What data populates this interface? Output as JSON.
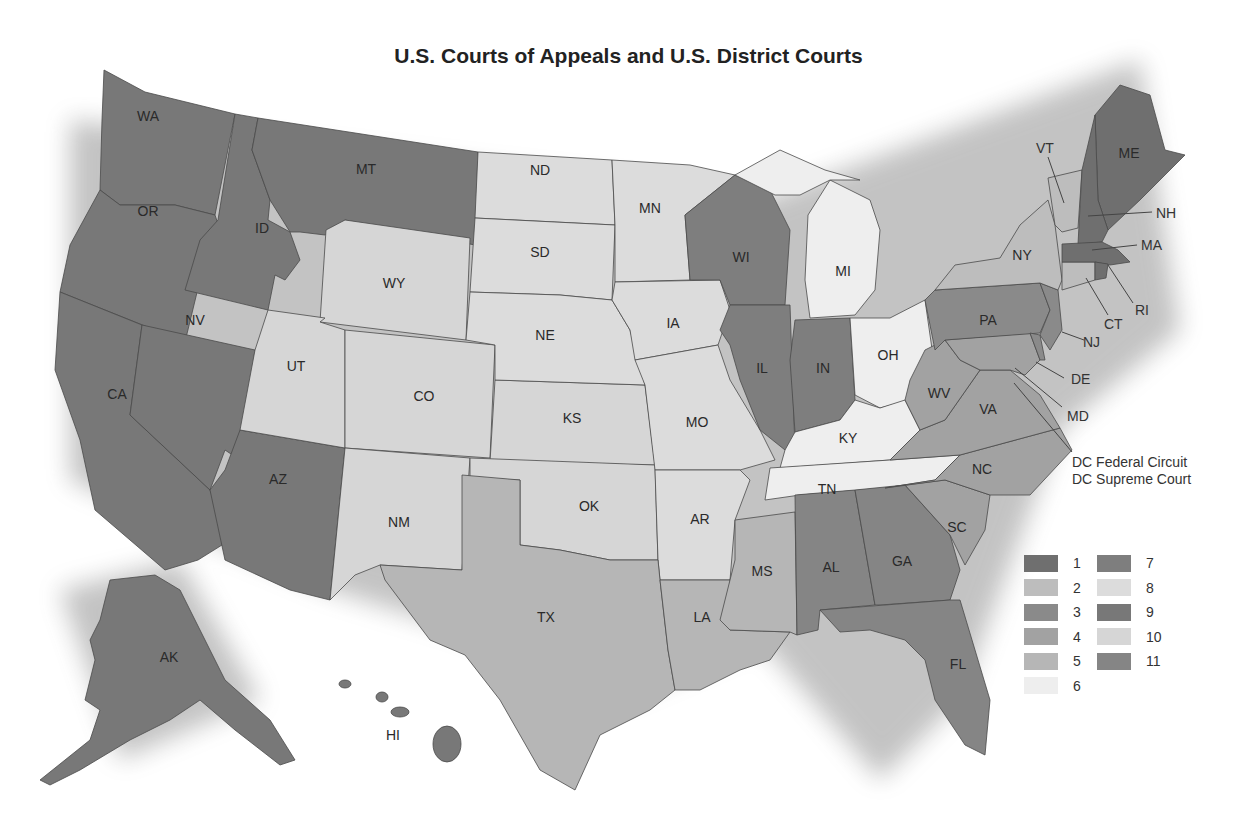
{
  "title": "U.S. Courts of Appeals and U.S. District Courts",
  "circuit_colors": {
    "1": "#6f6f6f",
    "2": "#bdbdbd",
    "3": "#8a8a8a",
    "4": "#a2a2a2",
    "5": "#b6b6b6",
    "6": "#eeeeee",
    "7": "#7e7e7e",
    "8": "#dcdcdc",
    "9": "#787878",
    "10": "#d6d6d6",
    "11": "#858585"
  },
  "legend": {
    "left_column": [
      {
        "circuit": "1",
        "label": "1"
      },
      {
        "circuit": "2",
        "label": "2"
      },
      {
        "circuit": "3",
        "label": "3"
      },
      {
        "circuit": "4",
        "label": "4"
      },
      {
        "circuit": "5",
        "label": "5"
      },
      {
        "circuit": "6",
        "label": "6"
      }
    ],
    "right_column": [
      {
        "circuit": "7",
        "label": "7"
      },
      {
        "circuit": "8",
        "label": "8"
      },
      {
        "circuit": "9",
        "label": "9"
      },
      {
        "circuit": "10",
        "label": "10"
      },
      {
        "circuit": "11",
        "label": "11"
      }
    ]
  },
  "states": [
    {
      "abbr": "WA",
      "circuit": "9"
    },
    {
      "abbr": "OR",
      "circuit": "9"
    },
    {
      "abbr": "CA",
      "circuit": "9"
    },
    {
      "abbr": "ID",
      "circuit": "9"
    },
    {
      "abbr": "MT",
      "circuit": "9"
    },
    {
      "abbr": "NV",
      "circuit": "9"
    },
    {
      "abbr": "AZ",
      "circuit": "9"
    },
    {
      "abbr": "AK",
      "circuit": "9"
    },
    {
      "abbr": "HI",
      "circuit": "9"
    },
    {
      "abbr": "WY",
      "circuit": "10"
    },
    {
      "abbr": "UT",
      "circuit": "10"
    },
    {
      "abbr": "CO",
      "circuit": "10"
    },
    {
      "abbr": "NM",
      "circuit": "10"
    },
    {
      "abbr": "KS",
      "circuit": "10"
    },
    {
      "abbr": "OK",
      "circuit": "10"
    },
    {
      "abbr": "ND",
      "circuit": "8"
    },
    {
      "abbr": "SD",
      "circuit": "8"
    },
    {
      "abbr": "NE",
      "circuit": "8"
    },
    {
      "abbr": "MN",
      "circuit": "8"
    },
    {
      "abbr": "IA",
      "circuit": "8"
    },
    {
      "abbr": "MO",
      "circuit": "8"
    },
    {
      "abbr": "AR",
      "circuit": "8"
    },
    {
      "abbr": "TX",
      "circuit": "5"
    },
    {
      "abbr": "LA",
      "circuit": "5"
    },
    {
      "abbr": "MS",
      "circuit": "5"
    },
    {
      "abbr": "WI",
      "circuit": "7"
    },
    {
      "abbr": "IL",
      "circuit": "7"
    },
    {
      "abbr": "IN",
      "circuit": "7"
    },
    {
      "abbr": "MI",
      "circuit": "6"
    },
    {
      "abbr": "OH",
      "circuit": "6"
    },
    {
      "abbr": "KY",
      "circuit": "6"
    },
    {
      "abbr": "TN",
      "circuit": "6"
    },
    {
      "abbr": "AL",
      "circuit": "11"
    },
    {
      "abbr": "GA",
      "circuit": "11"
    },
    {
      "abbr": "FL",
      "circuit": "11"
    },
    {
      "abbr": "SC",
      "circuit": "4"
    },
    {
      "abbr": "NC",
      "circuit": "4"
    },
    {
      "abbr": "VA",
      "circuit": "4"
    },
    {
      "abbr": "WV",
      "circuit": "4"
    },
    {
      "abbr": "MD",
      "circuit": "4"
    },
    {
      "abbr": "PA",
      "circuit": "3"
    },
    {
      "abbr": "NJ",
      "circuit": "3"
    },
    {
      "abbr": "DE",
      "circuit": "3"
    },
    {
      "abbr": "NY",
      "circuit": "2"
    },
    {
      "abbr": "VT",
      "circuit": "2"
    },
    {
      "abbr": "CT",
      "circuit": "2"
    },
    {
      "abbr": "ME",
      "circuit": "1"
    },
    {
      "abbr": "NH",
      "circuit": "1"
    },
    {
      "abbr": "MA",
      "circuit": "1"
    },
    {
      "abbr": "RI",
      "circuit": "1"
    }
  ],
  "callouts": {
    "VT": "VT",
    "NH": "NH",
    "MA": "MA",
    "RI": "RI",
    "CT": "CT",
    "NJ": "NJ",
    "DE": "DE",
    "MD": "MD",
    "dc_line1": "DC Federal Circuit",
    "dc_line2": "DC Supreme Court"
  }
}
